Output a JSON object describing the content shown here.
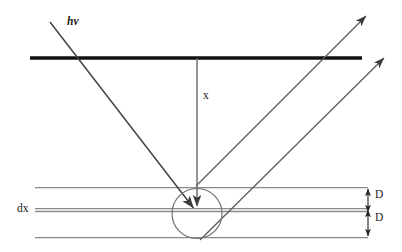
{
  "figure": {
    "background_color": "#ffffff",
    "width": 402,
    "height": 252,
    "labels": {
      "incident_photon": "hv",
      "depth": "x",
      "slab_thickness": "dx",
      "detector_gap_top": "D",
      "detector_gap_bottom": "D"
    },
    "colors": {
      "thick_line": "#111111",
      "ray_line": "#4a4a4a",
      "thin_line": "#8a8a8a",
      "circle": "#6b6b6b",
      "text": "#1a1a1a"
    },
    "geometry": {
      "surface_line": {
        "x1": 30,
        "y1": 58,
        "x2": 362,
        "y2": 58,
        "stroke_width": 3.2
      },
      "interaction_point": {
        "cx": 197,
        "cy": 213,
        "r": 25
      },
      "incident_ray": {
        "x1": 50,
        "y1": 22,
        "x2": 196,
        "y2": 211
      },
      "outgoing_ray_upper": {
        "x1": 196,
        "y1": 186,
        "x2": 368,
        "y2": 14
      },
      "outgoing_ray_lower": {
        "x1": 200,
        "y1": 240,
        "x2": 386,
        "y2": 56
      },
      "depth_arrow": {
        "x1": 197,
        "y1": 58,
        "x2": 197,
        "y2": 210
      },
      "slab_lines_y": [
        187,
        208,
        211,
        237
      ],
      "slab_line_x_start": 35,
      "slab_line_x_end": 368,
      "dimension_arrow_x": 368,
      "dimension_top": {
        "y1": 187,
        "y2": 210
      },
      "dimension_bottom": {
        "y1": 211,
        "y2": 237
      }
    }
  }
}
